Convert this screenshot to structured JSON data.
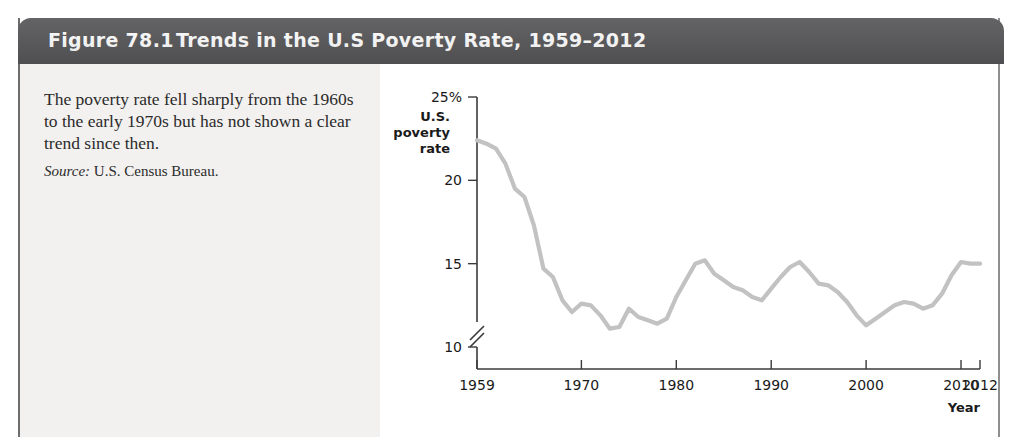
{
  "figure": {
    "number": "Figure 78.1",
    "title": "Trends in the U.S Poverty Rate, 1959–2012",
    "caption": "The poverty rate fell sharply from the 1960s to the early 1970s but has not shown a clear trend since then.",
    "source_label": "Source:",
    "source_text": "U.S. Census Bureau.",
    "header_color": "#58585a",
    "line_color": "#c2c2c2",
    "panel_color": "#f2f1ef"
  },
  "chart_data": {
    "type": "line",
    "title": "Trends in the U.S Poverty Rate, 1959–2012",
    "xlabel": "Year",
    "ylabel": "U.S. poverty rate",
    "ylabel_lines": [
      "U.S.",
      "poverty",
      "rate"
    ],
    "ytick_labels": [
      "25%",
      "20",
      "15",
      "10"
    ],
    "ytick_values": [
      25,
      20,
      15,
      10
    ],
    "xtick_labels": [
      "1959",
      "1970",
      "1980",
      "1990",
      "2000",
      "2010",
      "2012"
    ],
    "xtick_values": [
      1959,
      1970,
      1980,
      1990,
      2000,
      2010,
      2012
    ],
    "xlim": [
      1959,
      2012
    ],
    "ylim": [
      8.5,
      26
    ],
    "axis_break": true,
    "grid": false,
    "legend": "none",
    "series": [
      {
        "name": "U.S. poverty rate",
        "x": [
          1959,
          1960,
          1961,
          1962,
          1963,
          1964,
          1965,
          1966,
          1967,
          1968,
          1969,
          1970,
          1971,
          1972,
          1973,
          1974,
          1975,
          1976,
          1977,
          1978,
          1979,
          1980,
          1981,
          1982,
          1983,
          1984,
          1985,
          1986,
          1987,
          1988,
          1989,
          1990,
          1991,
          1992,
          1993,
          1994,
          1995,
          1996,
          1997,
          1998,
          1999,
          2000,
          2001,
          2002,
          2003,
          2004,
          2005,
          2006,
          2007,
          2008,
          2009,
          2010,
          2011,
          2012
        ],
        "values": [
          22.4,
          22.2,
          21.9,
          21.0,
          19.5,
          19.0,
          17.3,
          14.7,
          14.2,
          12.8,
          12.1,
          12.6,
          12.5,
          11.9,
          11.1,
          11.2,
          12.3,
          11.8,
          11.6,
          11.4,
          11.7,
          13.0,
          14.0,
          15.0,
          15.2,
          14.4,
          14.0,
          13.6,
          13.4,
          13.0,
          12.8,
          13.5,
          14.2,
          14.8,
          15.1,
          14.5,
          13.8,
          13.7,
          13.3,
          12.7,
          11.9,
          11.3,
          11.7,
          12.1,
          12.5,
          12.7,
          12.6,
          12.3,
          12.5,
          13.2,
          14.3,
          15.1,
          15.0,
          15.0
        ]
      }
    ]
  }
}
